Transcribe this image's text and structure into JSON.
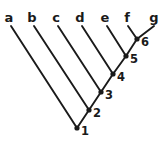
{
  "diagram": {
    "type": "cladogram",
    "background_color": "#ffffff",
    "line_color": "#1a1a1a",
    "canvas": {
      "width": 163,
      "height": 142
    }
  },
  "taxa": [
    {
      "id": "a",
      "label": "a",
      "label_x": 9,
      "label_y": 22,
      "tip_x": 11,
      "tip_y": 26,
      "parent": "1"
    },
    {
      "id": "b",
      "label": "b",
      "label_x": 32,
      "label_y": 22,
      "tip_x": 34,
      "tip_y": 26,
      "parent": "2"
    },
    {
      "id": "c",
      "label": "c",
      "label_x": 56,
      "label_y": 22,
      "tip_x": 58,
      "tip_y": 26,
      "parent": "3"
    },
    {
      "id": "d",
      "label": "d",
      "label_x": 80,
      "label_y": 22,
      "tip_x": 82,
      "tip_y": 26,
      "parent": "4"
    },
    {
      "id": "e",
      "label": "e",
      "label_x": 105,
      "label_y": 22,
      "tip_x": 107,
      "tip_y": 26,
      "parent": "5"
    },
    {
      "id": "f",
      "label": "f",
      "label_x": 127,
      "label_y": 22,
      "tip_x": 128,
      "tip_y": 26,
      "parent": "6"
    },
    {
      "id": "g",
      "label": "g",
      "label_x": 154,
      "label_y": 22,
      "tip_x": 154,
      "tip_y": 26,
      "parent": "6"
    }
  ],
  "nodes": [
    {
      "id": "1",
      "label": "1",
      "x": 77,
      "y": 128,
      "label_x": 81,
      "label_y": 135,
      "parent": null,
      "children": [
        "a",
        "2"
      ]
    },
    {
      "id": "2",
      "label": "2",
      "x": 89,
      "y": 110,
      "label_x": 93,
      "label_y": 117,
      "parent": "1",
      "children": [
        "b",
        "3"
      ]
    },
    {
      "id": "3",
      "label": "3",
      "x": 101,
      "y": 92,
      "label_x": 105,
      "label_y": 99,
      "parent": "2",
      "children": [
        "c",
        "4"
      ]
    },
    {
      "id": "4",
      "label": "4",
      "x": 113,
      "y": 74,
      "label_x": 117,
      "label_y": 81,
      "parent": "3",
      "children": [
        "d",
        "5"
      ]
    },
    {
      "id": "5",
      "label": "5",
      "x": 126,
      "y": 56,
      "label_x": 130,
      "label_y": 63,
      "parent": "4",
      "children": [
        "e",
        "6"
      ]
    },
    {
      "id": "6",
      "label": "6",
      "x": 137,
      "y": 39,
      "label_x": 141,
      "label_y": 46,
      "parent": "5",
      "children": [
        "f",
        "g"
      ]
    }
  ],
  "branches": [
    {
      "id": "branch-a",
      "from_x": 11,
      "from_y": 26,
      "to_x": 77,
      "to_y": 128,
      "taxon": "a",
      "node": "1"
    },
    {
      "id": "branch-b",
      "from_x": 34,
      "from_y": 26,
      "to_x": 89,
      "to_y": 110,
      "taxon": "b",
      "node": "2"
    },
    {
      "id": "branch-c",
      "from_x": 58,
      "from_y": 26,
      "to_x": 101,
      "to_y": 92,
      "taxon": "c",
      "node": "3"
    },
    {
      "id": "branch-d",
      "from_x": 82,
      "from_y": 26,
      "to_x": 113,
      "to_y": 74,
      "taxon": "d",
      "node": "4"
    },
    {
      "id": "branch-e",
      "from_x": 107,
      "from_y": 26,
      "to_x": 126,
      "to_y": 56,
      "taxon": "e",
      "node": "5"
    },
    {
      "id": "branch-f",
      "from_x": 128,
      "from_y": 26,
      "to_x": 137,
      "to_y": 39,
      "taxon": "f",
      "node": "6"
    },
    {
      "id": "branch-g",
      "from_x": 154,
      "from_y": 26,
      "to_x": 137,
      "to_y": 39,
      "taxon": "g",
      "node": "6"
    },
    {
      "id": "branch-1-2",
      "from_x": 77,
      "from_y": 128,
      "to_x": 89,
      "to_y": 110,
      "node": "1",
      "child_node": "2"
    },
    {
      "id": "branch-2-3",
      "from_x": 89,
      "from_y": 110,
      "to_x": 101,
      "to_y": 92,
      "node": "2",
      "child_node": "3"
    },
    {
      "id": "branch-3-4",
      "from_x": 101,
      "from_y": 92,
      "to_x": 113,
      "to_y": 74,
      "node": "3",
      "child_node": "4"
    },
    {
      "id": "branch-4-5",
      "from_x": 113,
      "from_y": 74,
      "to_x": 126,
      "to_y": 56,
      "node": "4",
      "child_node": "5"
    },
    {
      "id": "branch-5-6",
      "from_x": 126,
      "from_y": 56,
      "to_x": 137,
      "to_y": 39,
      "node": "5",
      "child_node": "6"
    }
  ],
  "node_dot_radius": 2.6
}
